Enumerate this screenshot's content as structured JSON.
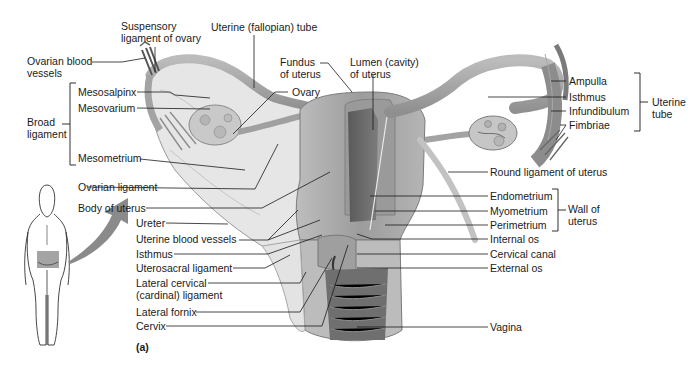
{
  "figure": {
    "panel_label": "(a)",
    "colors": {
      "background": "#ffffff",
      "tissue_light": "#d9d9d9",
      "tissue_mid": "#a8a8a8",
      "tissue_dark": "#6e6e6e",
      "leader_line": "#1a1a1a",
      "arrow": "#8a8a8a",
      "pelvis_highlight": "#9a9a9a"
    }
  },
  "labels": {
    "left": {
      "ovarian_blood_vessels": [
        "Ovarian blood",
        "vessels"
      ],
      "suspensory_ligament": [
        "Suspensory",
        "ligament of ovary"
      ],
      "uterine_tube_top": "Uterine (fallopian) tube",
      "broad_ligament": [
        "Broad",
        "ligament"
      ],
      "mesosalpinx": "Mesosalpinx",
      "mesovarium": "Mesovarium",
      "mesometrium": "Mesometrium",
      "ovary": "Ovary",
      "fundus": [
        "Fundus",
        "of uterus"
      ],
      "lumen": [
        "Lumen (cavity)",
        "of uterus"
      ],
      "ovarian_ligament": "Ovarian ligament",
      "body_of_uterus": "Body of uterus",
      "ureter": "Ureter",
      "uterine_blood_vessels": "Uterine blood vessels",
      "isthmus_uterus": "Isthmus",
      "uterosacral_ligament": "Uterosacral ligament",
      "lateral_cervical": [
        "Lateral cervical",
        "(cardinal) ligament"
      ],
      "lateral_fornix": "Lateral fornix",
      "cervix": "Cervix"
    },
    "right": {
      "ampulla": "Ampulla",
      "isthmus_tube": "Isthmus",
      "infundibulum": "Infundibulum",
      "fimbriae": "Fimbriae",
      "uterine_tube_group": [
        "Uterine",
        "tube"
      ],
      "round_ligament": "Round ligament of uterus",
      "endometrium": "Endometrium",
      "myometrium": "Myometrium",
      "perimetrium": "Perimetrium",
      "wall_of_uterus_group": [
        "Wall of",
        "uterus"
      ],
      "internal_os": "Internal os",
      "cervical_canal": "Cervical canal",
      "external_os": "External os",
      "vagina": "Vagina"
    }
  }
}
